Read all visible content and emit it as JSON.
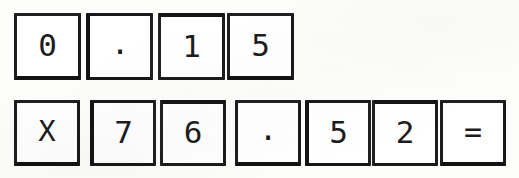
{
  "document": {
    "title": "Handwriting recognition character boxes",
    "background_color": "#fdfdfc",
    "ink_color": "#1c1c1c",
    "border_color": "#1b1b1b",
    "expression": "0.15 X 76.52 =",
    "operand_a": "0.15",
    "operand_b": "76.52",
    "operator": "X"
  },
  "rows": [
    {
      "name": "first-operand-row",
      "label": "0.15",
      "cells": [
        {
          "char": "0",
          "kind": "digit"
        },
        {
          "char": ".",
          "kind": "decimal-point"
        },
        {
          "char": "1",
          "kind": "digit"
        },
        {
          "char": "5",
          "kind": "digit"
        }
      ]
    },
    {
      "name": "second-operand-row",
      "label": "X 76.52 =",
      "cells": [
        {
          "char": "X",
          "kind": "operator-multiply"
        },
        {
          "char": "7",
          "kind": "digit"
        },
        {
          "char": "6",
          "kind": "digit"
        },
        {
          "char": ".",
          "kind": "decimal-point"
        },
        {
          "char": "5",
          "kind": "digit"
        },
        {
          "char": "2",
          "kind": "digit"
        },
        {
          "char": "=",
          "kind": "operator-equals"
        }
      ]
    }
  ],
  "geometry": {
    "row1": {
      "top": 13,
      "size": 67,
      "lefts": [
        14,
        86,
        158,
        227
      ]
    },
    "row2": {
      "top": 100,
      "size": 66,
      "lefts": [
        14,
        90,
        160,
        235,
        305,
        372,
        440
      ]
    }
  }
}
